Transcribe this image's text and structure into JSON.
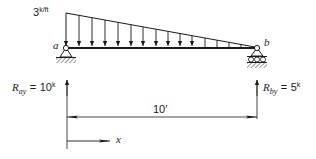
{
  "diagram": {
    "type": "simply supported beam with triangular distributed load",
    "load": {
      "magnitude": "3",
      "unit": "k/ft",
      "distribution": "linearly decreasing from left (a) to zero at right (b)",
      "arrow_count": 14
    },
    "supports": {
      "a": {
        "label": "a",
        "type": "pin"
      },
      "b": {
        "label": "b",
        "type": "roller"
      }
    },
    "reactions": {
      "left": {
        "symbol": "R",
        "subscript": "ay",
        "equals": "=",
        "value": "10",
        "unit": "k"
      },
      "right": {
        "symbol": "R",
        "subscript": "by",
        "equals": "=",
        "value": "5",
        "unit": "k"
      }
    },
    "dimension": {
      "label": "10′"
    },
    "axis": {
      "label": "x"
    }
  },
  "colors": {
    "ink": "#1a1a1a",
    "background": "#ffffff"
  }
}
